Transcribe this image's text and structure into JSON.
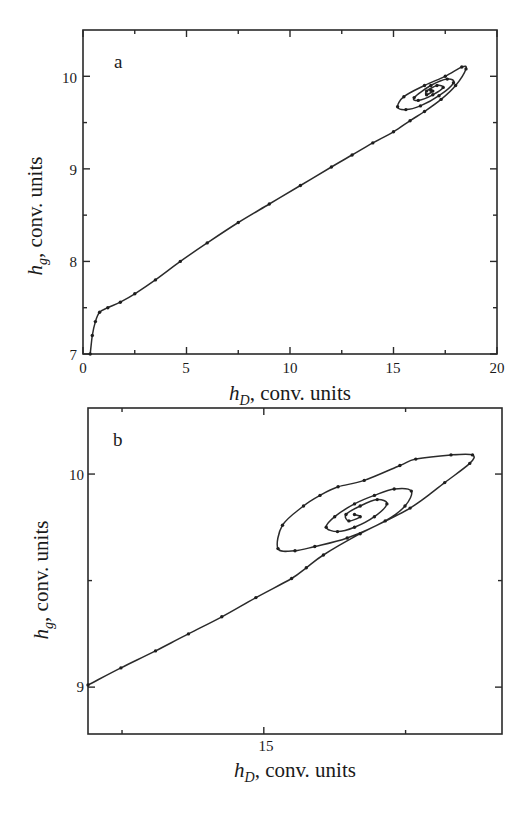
{
  "figure": {
    "panels": [
      {
        "letter": "a",
        "xlabel_main": "h",
        "xlabel_sub": "D",
        "xlabel_rest": ", conv. units",
        "ylabel_main": "h",
        "ylabel_sub": "g",
        "ylabel_rest": ", conv. units",
        "x_tick_labels": [
          "0",
          "5",
          "10",
          "15",
          "20"
        ],
        "y_tick_labels": [
          "7",
          "8",
          "9",
          "10"
        ]
      },
      {
        "letter": "b",
        "xlabel_main": "h",
        "xlabel_sub": "D",
        "xlabel_rest": ", conv. units",
        "ylabel_main": "h",
        "ylabel_sub": "g",
        "ylabel_rest": ", conv. units",
        "x_tick_labels": [
          "15"
        ],
        "y_tick_labels": [
          "9",
          "10"
        ]
      }
    ]
  },
  "chart_data": [
    {
      "type": "line",
      "panel": "a",
      "title": "",
      "xlabel": "h_D, conv. units",
      "ylabel": "h_g, conv. units",
      "xlim": [
        0,
        20
      ],
      "ylim": [
        7,
        10.5
      ],
      "grid": false,
      "x_ticks_major": [
        0,
        5,
        10,
        15,
        20
      ],
      "x_ticks_minor": [
        2.5,
        7.5,
        12.5,
        17.5
      ],
      "y_ticks_major": [
        7,
        8,
        9,
        10
      ],
      "y_ticks_minor": [
        7.5,
        8.5,
        9.5
      ],
      "description": "Trajectory with dot markers rising from (0.35, 7) steeply to a knee near (0.8, 7.45), then nearly linear to ~(15.5, 9.6), then spiraling inward around a stable focus at about (16.8, 9.85)",
      "series": [
        {
          "name": "trajectory",
          "x": [
            0.35,
            0.45,
            0.6,
            0.8,
            1.2,
            1.8,
            2.5,
            3.5,
            4.7,
            6.0,
            7.5,
            9.0,
            10.5,
            12.0,
            13.0,
            14.0,
            15.0,
            15.8,
            16.5,
            17.3,
            18.0,
            18.5,
            18.3,
            17.5,
            16.5,
            15.5,
            15.2,
            15.6,
            16.3,
            17.2,
            17.9,
            17.6,
            16.8,
            16.0,
            16.2,
            16.9,
            17.4,
            17.1,
            16.6,
            16.6,
            16.9,
            16.8
          ],
          "y": [
            7.0,
            7.2,
            7.35,
            7.45,
            7.5,
            7.56,
            7.65,
            7.8,
            8.0,
            8.2,
            8.42,
            8.62,
            8.82,
            9.02,
            9.15,
            9.28,
            9.4,
            9.52,
            9.62,
            9.75,
            9.9,
            10.08,
            10.1,
            10.0,
            9.9,
            9.78,
            9.67,
            9.64,
            9.68,
            9.79,
            9.93,
            9.97,
            9.9,
            9.77,
            9.74,
            9.8,
            9.88,
            9.9,
            9.84,
            9.8,
            9.84,
            9.85
          ]
        }
      ]
    },
    {
      "type": "line",
      "panel": "b",
      "title": "",
      "xlabel": "h_D, conv. units",
      "ylabel": "h_g, conv. units",
      "xlim": [
        11.9,
        19.2
      ],
      "ylim": [
        8.78,
        10.31
      ],
      "grid": false,
      "x_ticks_major": [
        15
      ],
      "x_ticks_minor": [
        12.5,
        17.5
      ],
      "y_ticks_major": [
        9,
        10
      ],
      "y_ticks_minor": [
        9.5
      ],
      "description": "Zoomed view of the same trajectory: near-linear approach from (11.9, 9.01) then spiraling inward around a focus at about (16.6, 9.81)",
      "series": [
        {
          "name": "trajectory",
          "x": [
            11.9,
            12.48,
            13.09,
            13.67,
            14.26,
            14.86,
            15.49,
            15.75,
            16.05,
            16.7,
            17.58,
            18.19,
            18.63,
            18.68,
            18.3,
            17.68,
            17.4,
            16.77,
            16.31,
            15.99,
            15.7,
            15.33,
            15.25,
            15.55,
            15.9,
            16.47,
            17.14,
            17.49,
            17.6,
            17.3,
            16.95,
            16.6,
            16.25,
            16.1,
            16.3,
            16.6,
            16.95,
            17.17,
            17.0,
            16.7,
            16.45,
            16.5,
            16.7,
            16.6
          ],
          "y": [
            9.01,
            9.09,
            9.17,
            9.25,
            9.33,
            9.42,
            9.51,
            9.56,
            9.62,
            9.72,
            9.84,
            9.96,
            10.05,
            10.09,
            10.09,
            10.07,
            10.04,
            9.97,
            9.94,
            9.9,
            9.85,
            9.76,
            9.65,
            9.64,
            9.66,
            9.7,
            9.78,
            9.85,
            9.92,
            9.93,
            9.9,
            9.86,
            9.8,
            9.75,
            9.73,
            9.75,
            9.8,
            9.86,
            9.88,
            9.85,
            9.81,
            9.78,
            9.8,
            9.81
          ]
        }
      ]
    }
  ]
}
